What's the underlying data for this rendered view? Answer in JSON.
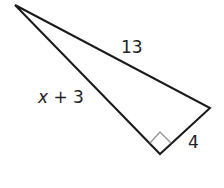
{
  "figure": {
    "type": "right-triangle",
    "vertices": {
      "top": [
        15,
        5
      ],
      "right": [
        210,
        108
      ],
      "bottom_right_angle": [
        160,
        154
      ]
    },
    "labels": {
      "hypotenuse": "13",
      "leg_long_var": "x",
      "leg_long_rest": " + 3",
      "leg_short": "4"
    },
    "colors": {
      "stroke": "#1a1a1a",
      "right_angle_marker": "#9a9a9a",
      "text": "#222222"
    }
  }
}
